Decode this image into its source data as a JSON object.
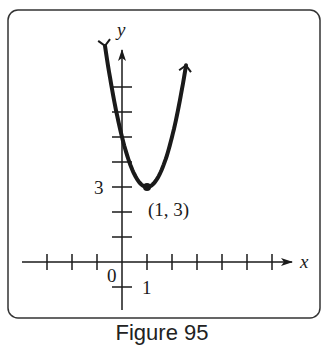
{
  "figure": {
    "caption": "Figure 95"
  },
  "chart_data": {
    "type": "line",
    "title": "",
    "function": "y = 2(x - 1)^2 + 3",
    "xlabel": "x",
    "ylabel": "y",
    "x_tick_labels": {
      "0": "0",
      "1": "1"
    },
    "y_tick_labels": {
      "3": "3"
    },
    "x_ticks": [
      -3,
      -2,
      -1,
      1,
      2,
      3,
      4,
      5,
      6
    ],
    "y_ticks": [
      -1,
      1,
      2,
      3,
      4,
      5,
      6,
      7
    ],
    "xlim": [
      -3.8,
      6.6
    ],
    "ylim": [
      -1.9,
      8.4
    ],
    "grid": false,
    "vertex": {
      "x": 1,
      "y": 3,
      "label": "(1, 3)"
    },
    "origin_label": "0",
    "series": [
      {
        "name": "parabola",
        "x": [
          -0.7,
          -0.5,
          0,
          0.5,
          1,
          1.5,
          2,
          2.5
        ],
        "y": [
          8.78,
          7.5,
          5,
          3.5,
          3,
          3.5,
          5,
          7.5
        ]
      }
    ]
  },
  "colors": {
    "ink": "#1a1a1a",
    "frame": "#333333",
    "background": "#ffffff"
  }
}
